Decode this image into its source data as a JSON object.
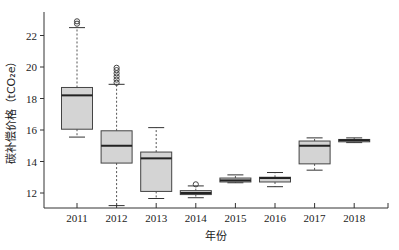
{
  "chart_data": {
    "type": "boxplot",
    "title": "",
    "xlabel": "年份",
    "ylabel": "碳补偿价格（tCO₂e）",
    "ylim": [
      11.1,
      23.4
    ],
    "yticks": [
      12,
      14,
      16,
      18,
      20,
      22
    ],
    "categories": [
      "2011",
      "2012",
      "2013",
      "2014",
      "2015",
      "2016",
      "2017",
      "2018"
    ],
    "grid": false,
    "legend": null,
    "box_fill": "#d4d4d4",
    "series": [
      {
        "category": "2011",
        "whisker_low": 15.55,
        "q1": 16.05,
        "median": 18.2,
        "q3": 18.7,
        "whisker_high": 22.5,
        "outliers": [
          22.75,
          22.9
        ]
      },
      {
        "category": "2012",
        "whisker_low": 11.2,
        "q1": 13.9,
        "median": 15.0,
        "q3": 15.95,
        "whisker_high": 18.9,
        "outliers": [
          19.0,
          19.2,
          19.4,
          19.6,
          19.8,
          19.95
        ]
      },
      {
        "category": "2013",
        "whisker_low": 11.65,
        "q1": 12.1,
        "median": 14.2,
        "q3": 14.6,
        "whisker_high": 16.15,
        "outliers": []
      },
      {
        "category": "2014",
        "whisker_low": 11.7,
        "q1": 11.9,
        "median": 12.0,
        "q3": 12.15,
        "whisker_high": 12.45,
        "outliers": [
          12.55
        ]
      },
      {
        "category": "2015",
        "whisker_low": 12.65,
        "q1": 12.7,
        "median": 12.8,
        "q3": 12.95,
        "whisker_high": 13.15,
        "outliers": []
      },
      {
        "category": "2016",
        "whisker_low": 12.4,
        "q1": 12.7,
        "median": 12.95,
        "q3": 13.0,
        "whisker_high": 13.3,
        "outliers": []
      },
      {
        "category": "2017",
        "whisker_low": 13.45,
        "q1": 13.85,
        "median": 15.0,
        "q3": 15.3,
        "whisker_high": 15.5,
        "outliers": []
      },
      {
        "category": "2018",
        "whisker_low": 15.2,
        "q1": 15.25,
        "median": 15.35,
        "q3": 15.4,
        "whisker_high": 15.5,
        "outliers": []
      }
    ]
  }
}
